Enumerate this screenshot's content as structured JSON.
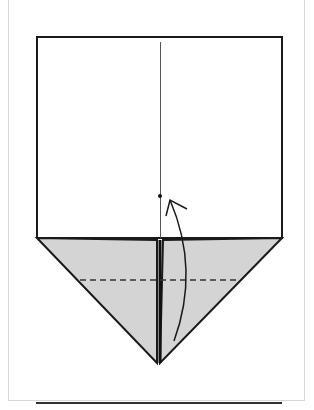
{
  "diagram": {
    "type": "origami-fold-step",
    "colors": {
      "paper_front": "#ffffff",
      "paper_back": "#d4d4d4",
      "line": "#1a1a1a",
      "frame": "#d8d8d8"
    },
    "square": {
      "x": 37,
      "y": 37,
      "width": 245,
      "height": 201
    },
    "triangle": {
      "left": [
        37,
        238
      ],
      "right": [
        282,
        238
      ],
      "tip": [
        160,
        363
      ]
    },
    "center_crease": {
      "x": 160,
      "y1": 42,
      "y2": 238
    },
    "dot": [
      160,
      196
    ],
    "valley_fold_y": 280,
    "arrow": "fold tip up to dot"
  }
}
